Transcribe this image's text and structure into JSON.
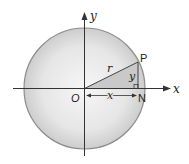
{
  "diagram": {
    "labels": {
      "y_axis": "y",
      "x_axis": "x",
      "origin": "O",
      "point_p": "P",
      "point_n": "N",
      "radius": "r",
      "opposite": "y",
      "adjacent": "x"
    },
    "colors": {
      "circle_center": "#f4f4f4",
      "circle_edge": "#cfcfcf",
      "circle_stroke": "#8c8c8c",
      "triangle_fill": "#c9c9c9",
      "line": "#333333"
    }
  }
}
